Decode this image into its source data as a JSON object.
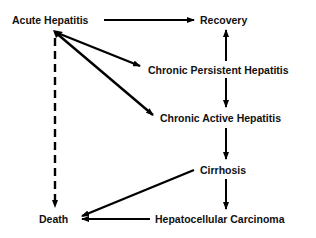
{
  "diagram": {
    "type": "flow",
    "nodes": {
      "acute_hepatitis": "Acute Hepatitis",
      "recovery": "Recovery",
      "chronic_persistent": "Chronic Persistent Hepatitis",
      "chronic_active": "Chronic Active Hepatitis",
      "cirrhosis": "Cirrhosis",
      "death": "Death",
      "hcc": "Hepatocellular Carcinoma"
    },
    "edges": [
      {
        "from": "Acute Hepatitis",
        "to": "Recovery",
        "style": "solid"
      },
      {
        "from": "Acute Hepatitis",
        "to": "Chronic Persistent Hepatitis",
        "style": "solid"
      },
      {
        "from": "Acute Hepatitis",
        "to": "Chronic Active Hepatitis",
        "style": "solid"
      },
      {
        "from": "Acute Hepatitis",
        "to": "Death",
        "style": "dashed"
      },
      {
        "from": "Chronic Persistent Hepatitis",
        "to": "Recovery",
        "style": "solid"
      },
      {
        "from": "Chronic Persistent Hepatitis",
        "to": "Chronic Active Hepatitis",
        "style": "solid"
      },
      {
        "from": "Chronic Active Hepatitis",
        "to": "Cirrhosis",
        "style": "solid"
      },
      {
        "from": "Cirrhosis",
        "to": "Hepatocellular Carcinoma",
        "style": "solid"
      },
      {
        "from": "Cirrhosis",
        "to": "Death",
        "style": "solid"
      },
      {
        "from": "Hepatocellular Carcinoma",
        "to": "Death",
        "style": "solid"
      }
    ],
    "colors": {
      "line": "#000000",
      "text": "#111111",
      "background": "#ffffff"
    }
  }
}
